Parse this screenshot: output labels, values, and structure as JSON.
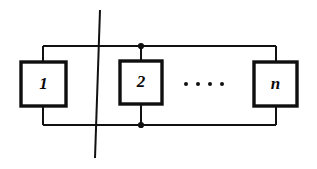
{
  "figure": {
    "type": "block-diagram",
    "background_color": "#ffffff",
    "line_color": "#111111",
    "box_fill": "#ffffff",
    "box_stroke": "#0f0f0f",
    "box_stroke_width": 3.4,
    "bus_stroke_width": 2.0,
    "crossing_line_stroke_width": 2.0,
    "junction_dot_color": "#111111",
    "junction_dot_radius": 3.1,
    "ellipsis_dot_color": "#111111",
    "ellipsis_dot_radius": 2.0
  },
  "blocks": [
    {
      "name": "block-1",
      "label": "1",
      "x": 21,
      "y": 62,
      "width": 45,
      "height": 44,
      "stub_x": 43,
      "has_junction_dots": false
    },
    {
      "name": "block-2",
      "label": "2",
      "x": 120,
      "y": 61,
      "width": 42,
      "height": 43,
      "stub_x": 141,
      "has_junction_dots": true
    },
    {
      "name": "block-n",
      "label": "n",
      "x": 254,
      "y": 62,
      "width": 43,
      "height": 44,
      "stub_x": 276,
      "has_junction_dots": false
    }
  ],
  "buses": {
    "top": {
      "name": "top-bus",
      "y": 46,
      "x_start": 43,
      "x_end": 276
    },
    "bottom": {
      "name": "bottom-bus",
      "y": 125,
      "x_start": 43,
      "x_end": 276
    }
  },
  "junction_dots": [
    {
      "name": "junction-dot-top",
      "x": 141,
      "y": 46
    },
    {
      "name": "junction-dot-bottom",
      "x": 141,
      "y": 125
    }
  ],
  "crossing_line": {
    "name": "crossing-line",
    "x_top": 100,
    "y_top": 10,
    "x_bottom": 95,
    "y_bottom": 158
  },
  "ellipsis": {
    "name": "ellipsis",
    "text": "....",
    "y": 84,
    "dots": [
      {
        "x": 186
      },
      {
        "x": 198
      },
      {
        "x": 210
      },
      {
        "x": 222
      }
    ]
  }
}
